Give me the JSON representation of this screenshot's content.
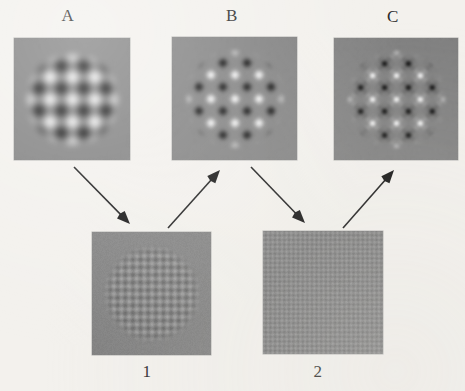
{
  "figure": {
    "background_color": "#f3f1ed",
    "panel_gray": "#808080",
    "arrow_color": "#111111",
    "width": 465,
    "height": 391
  },
  "top_row": [
    {
      "label": "A",
      "name": "stimulus-panel-a",
      "x": 14,
      "y": 38,
      "w": 116,
      "h": 122,
      "pattern": "plaid-checkerboard",
      "aperture": "circle",
      "aperture_radius": 44,
      "cycles": 2.6,
      "contrast": 0.92,
      "harmonics": [
        1
      ],
      "blur": 2.6,
      "description": "smooth blurred plaid of two oblique sinusoidal gratings in circular aperture"
    },
    {
      "label": "B",
      "name": "stimulus-panel-b",
      "x": 172,
      "y": 37,
      "w": 125,
      "h": 123,
      "pattern": "plaid-checkerboard",
      "aperture": "circle",
      "aperture_radius": 46,
      "cycles": 2.6,
      "contrast": 0.97,
      "harmonics": [
        1,
        3
      ],
      "blur": 1.4,
      "description": "sharper diamond checkerboard, fundamental plus third harmonic"
    },
    {
      "label": "C",
      "name": "stimulus-panel-c",
      "x": 334,
      "y": 38,
      "w": 124,
      "h": 122,
      "pattern": "plaid-checkerboard",
      "aperture": "circle",
      "aperture_radius": 46,
      "cycles": 2.6,
      "contrast": 1.0,
      "harmonics": [
        1,
        3,
        5
      ],
      "blur": 0.9,
      "description": "crisp square-wave checkerboard rotated 45 degrees"
    }
  ],
  "bottom_row": [
    {
      "label": "1",
      "name": "stimulus-panel-1",
      "x": 92,
      "y": 232,
      "w": 119,
      "h": 123,
      "pattern": "plaid-checkerboard",
      "aperture": "circle",
      "aperture_radius": 45,
      "cycles": 7.8,
      "contrast": 0.22,
      "harmonics": [
        1
      ],
      "blur": 0.7,
      "description": "low contrast fine checkerboard, third harmonic component, circular aperture"
    },
    {
      "label": "2",
      "name": "stimulus-panel-2",
      "x": 263,
      "y": 231,
      "w": 120,
      "h": 123,
      "pattern": "plaid-checkerboard",
      "aperture": "square",
      "aperture_radius": 0,
      "cycles": 13.0,
      "contrast": 0.13,
      "harmonics": [
        1
      ],
      "blur": 0.5,
      "description": "very low contrast very fine checkerboard, fifth harmonic component, full square"
    }
  ],
  "labels": {
    "a": {
      "text": "A",
      "x": 68,
      "y": 7
    },
    "b": {
      "text": "B",
      "x": 232,
      "y": 7
    },
    "c": {
      "text": "C",
      "x": 393,
      "y": 8
    },
    "one": {
      "text": "1",
      "x": 147,
      "y": 363
    },
    "two": {
      "text": "2",
      "x": 318,
      "y": 363
    }
  },
  "arrows": [
    {
      "name": "arrow-a-to-1",
      "from": "A",
      "to": "1",
      "x1": 74,
      "y1": 167,
      "x2": 130,
      "y2": 224,
      "direction": "down-right"
    },
    {
      "name": "arrow-1-to-b",
      "from": "1",
      "to": "B",
      "x1": 168,
      "y1": 228,
      "x2": 220,
      "y2": 170,
      "direction": "up-right"
    },
    {
      "name": "arrow-b-to-2",
      "from": "B",
      "to": "2",
      "x1": 251,
      "y1": 167,
      "x2": 305,
      "y2": 223,
      "direction": "down-right"
    },
    {
      "name": "arrow-2-to-c",
      "from": "2",
      "to": "C",
      "x1": 343,
      "y1": 228,
      "x2": 394,
      "y2": 170,
      "direction": "up-right"
    }
  ]
}
